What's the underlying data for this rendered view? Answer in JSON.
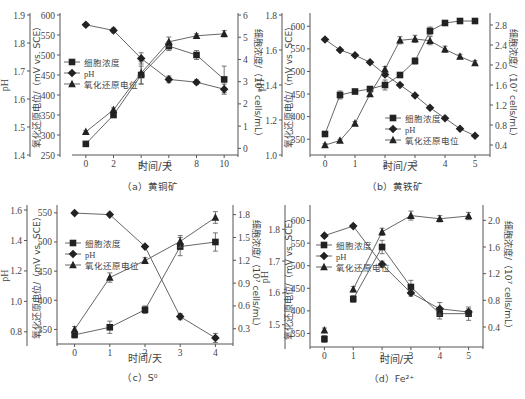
{
  "figure": {
    "legend_labels": {
      "cells": "细胞浓度",
      "ph": "pH",
      "orp": "氧化还原电位"
    },
    "axis_labels": {
      "x": "时间/天",
      "ph": "pH",
      "orp": "氧化还原电位/（mV vs. SCE）",
      "cells_a": "细胞浓度/（10⁸ cells/mL）",
      "cells_b": "细胞浓度/（10⁷ cells/mL）",
      "cells_c": "细胞浓度/（10⁷ cells/mL）",
      "cells_d": "细胞浓度/（10⁷ cells/mL）"
    },
    "colors": {
      "line": "#555555",
      "marker": "#222222",
      "axis": "#555555",
      "text": "#444444"
    }
  },
  "chart_data": [
    {
      "type": "line",
      "panel": "a",
      "caption": "（a）黄铜矿",
      "xlabel": "时间/天",
      "x": [
        0,
        2,
        4,
        6,
        8,
        10
      ],
      "x_ticks": [
        "0",
        "2",
        "4",
        "6",
        "8",
        "10"
      ],
      "xlim": [
        -1,
        11
      ],
      "axes": {
        "ph": {
          "label": "pH",
          "lim": [
            1.4,
            1.9
          ],
          "ticks": [
            "1.4",
            "1.5",
            "1.6",
            "1.7",
            "1.8",
            "1.9"
          ]
        },
        "orp": {
          "label": "氧化还原电位/（mV vs. SCE）",
          "lim": [
            250,
            600
          ],
          "ticks": [
            "250",
            "300",
            "350",
            "400",
            "450",
            "500",
            "550",
            "600"
          ]
        },
        "cells": {
          "label": "细胞浓度/（10⁸ cells/mL）",
          "lim": [
            -0.3,
            6
          ],
          "ticks": [
            "0",
            "1",
            "2",
            "3",
            "4",
            "5",
            "6"
          ]
        }
      },
      "legend_position": "center-left",
      "series": [
        {
          "name": "细胞浓度",
          "marker": "square",
          "axis": "cells",
          "values": [
            0.2,
            1.5,
            3.3,
            4.6,
            4.2,
            3.1
          ],
          "errors": [
            0.05,
            0.1,
            0.4,
            0.2,
            0.2,
            0.6
          ]
        },
        {
          "name": "pH",
          "marker": "diamond",
          "axis": "ph",
          "values": [
            1.865,
            1.845,
            1.745,
            1.67,
            1.66,
            1.635
          ],
          "errors": [
            0.005,
            0.008,
            0.02,
            0.012,
            0.008,
            0.018
          ]
        },
        {
          "name": "氧化还原电位",
          "marker": "triangle",
          "axis": "orp",
          "values": [
            308,
            363,
            455,
            533,
            548,
            553
          ],
          "errors": [
            3,
            5,
            28,
            12,
            5,
            8
          ]
        }
      ]
    },
    {
      "type": "line",
      "panel": "b",
      "caption": "（b）黄铁矿",
      "xlabel": "时间/天",
      "x": [
        0,
        0.5,
        1,
        1.5,
        2,
        2.5,
        3,
        3.5,
        4,
        4.5,
        5
      ],
      "x_ticks": [
        "0",
        "1",
        "2",
        "3",
        "4",
        "5"
      ],
      "xlim": [
        -0.5,
        5.5
      ],
      "axes": {
        "ph": {
          "label": "pH",
          "lim": [
            1.0,
            1.8
          ],
          "ticks": [
            "1.0",
            "1.2",
            "1.4",
            "1.6",
            "1.8"
          ]
        },
        "orp": {
          "label": "氧化还原电位/（mV vs. SCE）",
          "lim": [
            315,
            625
          ],
          "ticks": [
            "350",
            "400",
            "450",
            "500",
            "550",
            "600"
          ]
        },
        "cells": {
          "label": "细胞浓度/（10⁷ cells/mL）",
          "lim": [
            0.2,
            3.0
          ],
          "ticks": [
            "0.4",
            "0.8",
            "1.2",
            "1.6",
            "2.0",
            "2.4",
            "2.8"
          ]
        }
      },
      "legend_position": "bottom-right",
      "series": [
        {
          "name": "细胞浓度",
          "marker": "square",
          "axis": "cells",
          "values": [
            0.62,
            1.4,
            1.47,
            1.52,
            1.6,
            1.8,
            2.08,
            2.68,
            2.84,
            2.88,
            2.88
          ],
          "errors": [
            0.02,
            0.08,
            0.04,
            0.04,
            0.1,
            0.04,
            0.06,
            0.08,
            0.02,
            0.02,
            0.05
          ]
        },
        {
          "name": "pH",
          "marker": "diamond",
          "axis": "ph",
          "values": [
            1.66,
            1.6,
            1.57,
            1.53,
            1.46,
            1.4,
            1.34,
            1.27,
            1.21,
            1.15,
            1.11
          ],
          "errors": [
            0.005,
            0.005,
            0.005,
            0.005,
            0.01,
            0.005,
            0.005,
            0.005,
            0.005,
            0.005,
            0.005
          ]
        },
        {
          "name": "氧化还原电位",
          "marker": "triangle",
          "axis": "orp",
          "values": [
            337,
            347,
            385,
            450,
            505,
            569,
            572,
            568,
            549,
            533,
            519
          ],
          "errors": [
            3,
            3,
            4,
            5,
            6,
            8,
            8,
            9,
            7,
            5,
            5
          ]
        }
      ]
    },
    {
      "type": "line",
      "panel": "c",
      "caption": "（c）S⁰",
      "xlabel": "时间/天",
      "x": [
        0,
        1,
        2,
        3,
        4
      ],
      "x_ticks": [
        "0",
        "1",
        "2",
        "3",
        "4"
      ],
      "xlim": [
        -0.5,
        4.5
      ],
      "axes": {
        "ph": {
          "label": "pH",
          "lim": [
            0.72,
            1.62
          ],
          "ticks": [
            "0.8",
            "1.0",
            "1.2",
            "1.4",
            "1.6"
          ]
        },
        "orp": {
          "label": "氧化还原电位/（mV vs. SCE）",
          "lim": [
            325,
            560
          ],
          "ticks": [
            "350",
            "400",
            "450",
            "500",
            "550"
          ]
        },
        "cells": {
          "label": "细胞浓度/（10⁷ cells/mL）",
          "lim": [
            0.1,
            1.9
          ],
          "ticks": [
            "0.3",
            "0.6",
            "0.9",
            "1.2",
            "1.5",
            "1.8"
          ]
        }
      },
      "legend_position": "center-left",
      "series": [
        {
          "name": "细胞浓度",
          "marker": "square",
          "axis": "cells",
          "values": [
            0.22,
            0.32,
            0.55,
            1.38,
            1.44
          ],
          "errors": [
            0.04,
            0.08,
            0.05,
            0.12,
            0.12
          ]
        },
        {
          "name": "pH",
          "marker": "diamond",
          "axis": "ph",
          "values": [
            1.58,
            1.57,
            1.36,
            0.9,
            0.76
          ],
          "errors": [
            0.005,
            0.005,
            0.005,
            0.02,
            0.03
          ]
        },
        {
          "name": "氧化还原电位",
          "marker": "triangle",
          "axis": "orp",
          "values": [
            350,
            439,
            468,
            501,
            542
          ],
          "errors": [
            5,
            8,
            5,
            10,
            10
          ]
        }
      ]
    },
    {
      "type": "line",
      "panel": "d",
      "caption": "（d）Fe²⁺",
      "xlabel": "时间/天",
      "x": [
        0,
        1,
        2,
        3,
        4,
        5
      ],
      "x_ticks": [
        "0",
        "1",
        "2",
        "3",
        "4",
        "5"
      ],
      "xlim": [
        -0.5,
        5.5
      ],
      "axes": {
        "ph": {
          "label": "pH",
          "lim": [
            1.43,
            1.87
          ],
          "ticks": [
            "1.5",
            "1.6",
            "1.7",
            "1.8"
          ]
        },
        "orp": {
          "label": "氧化还原电位/（mV vs. SCE）",
          "lim": [
            320,
            630
          ],
          "ticks": [
            "350",
            "400",
            "450",
            "500",
            "550",
            "600"
          ]
        },
        "cells": {
          "label": "细胞浓度/（10⁷ cells/mL）",
          "lim": [
            0.1,
            2.2
          ],
          "ticks": [
            "0.4",
            "0.8",
            "1.2",
            "1.6",
            "2.0"
          ]
        }
      },
      "legend_position": "top-left",
      "series": [
        {
          "name": "细胞浓度",
          "marker": "square",
          "axis": "cells",
          "values": [
            0.22,
            0.82,
            1.6,
            1.0,
            0.6,
            0.6
          ],
          "errors": [
            0.05,
            0.05,
            0.1,
            0.1,
            0.08,
            0.1
          ]
        },
        {
          "name": "pH",
          "marker": "diamond",
          "axis": "ph",
          "values": [
            1.78,
            1.81,
            1.69,
            1.6,
            1.55,
            1.54
          ],
          "errors": [
            0.005,
            0.005,
            0.01,
            0.01,
            0.02,
            0.01
          ]
        },
        {
          "name": "氧化还原电位",
          "marker": "triangle",
          "axis": "orp",
          "values": [
            357,
            448,
            575,
            611,
            604,
            610
          ],
          "errors": [
            5,
            6,
            8,
            10,
            7,
            8
          ]
        }
      ]
    }
  ]
}
